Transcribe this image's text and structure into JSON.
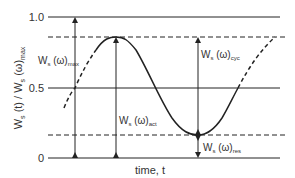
{
  "diagram": {
    "y_axis_label": "W",
    "y_axis_label_parts": {
      "base": "W",
      "sub1": "s",
      "mid": " (t) / W",
      "sub2": "s",
      "mid2": " (ω)",
      "sub3": "max"
    },
    "x_axis_label": "time, t",
    "y_ticks": [
      "1.0",
      "0.5",
      "0"
    ],
    "annotations": {
      "max": {
        "base": "W",
        "sub": "s",
        "mid": " (ω)",
        "sub2": "max"
      },
      "act": {
        "base": "W",
        "sub": "s",
        "mid": " (ω)",
        "sub2": "act"
      },
      "cyc": {
        "base": "W",
        "sub": "s",
        "mid": " (ω)",
        "sub2": "cyc"
      },
      "res": {
        "base": "W",
        "sub": "s",
        "mid": " (ω)",
        "sub2": "res"
      }
    },
    "colors": {
      "line": "#222222",
      "text": "#333333",
      "background": "#ffffff"
    }
  }
}
